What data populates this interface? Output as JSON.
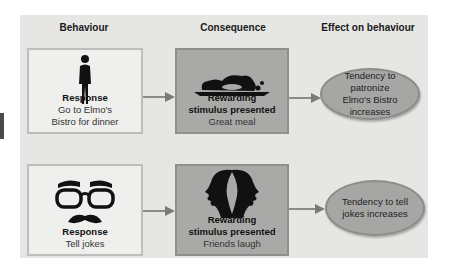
{
  "headers": {
    "behaviour": "Behaviour",
    "consequence": "Consequence",
    "effect": "Effect on behaviour"
  },
  "rows": [
    {
      "behaviour": {
        "icon": "standing-man-icon",
        "title": "Response",
        "line1": "Go to Elmo's",
        "line2": "Bistro for dinner"
      },
      "consequence": {
        "icon": "plated-meal-icon",
        "title_line1": "Rewarding",
        "title_line2": "stimulus presented",
        "sub": "Great meal"
      },
      "effect": {
        "line1": "Tendency to patronize",
        "line2": "Elmo's Bistro increases"
      }
    },
    {
      "behaviour": {
        "icon": "groucho-glasses-icon",
        "title": "Response",
        "line1": "Tell jokes"
      },
      "consequence": {
        "icon": "laughing-faces-icon",
        "title_line1": "Rewarding",
        "title_line2": "stimulus presented",
        "sub": "Friends laugh"
      },
      "effect": {
        "line1": "Tendency to tell",
        "line2": "jokes increases"
      }
    }
  ],
  "colors": {
    "panel": "#e6e6e4",
    "light_box": "#efefed",
    "dark_box": "#a9a9a7",
    "ellipse": "#a6a6a4",
    "arrow": "#8a8a88"
  }
}
